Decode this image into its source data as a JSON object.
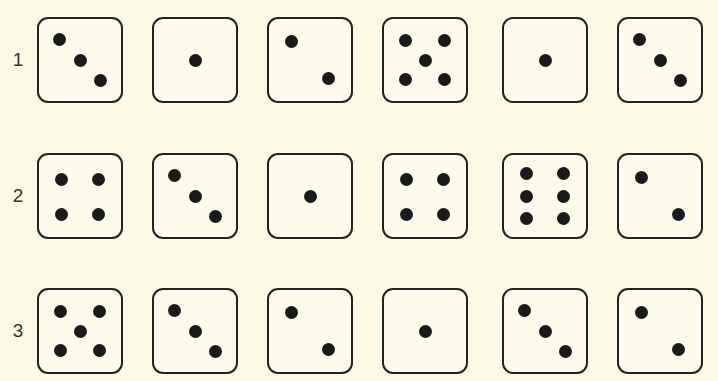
{
  "figure": {
    "rows": [
      {
        "label": "1",
        "dice": [
          {
            "value": 3,
            "orientation": "tl-br"
          },
          {
            "value": 1,
            "orientation": "center"
          },
          {
            "value": 2,
            "orientation": "tl-br"
          },
          {
            "value": 5,
            "orientation": "standard"
          },
          {
            "value": 1,
            "orientation": "center"
          },
          {
            "value": 3,
            "orientation": "tl-br"
          }
        ]
      },
      {
        "label": "2",
        "dice": [
          {
            "value": 4,
            "orientation": "standard"
          },
          {
            "value": 3,
            "orientation": "tl-br"
          },
          {
            "value": 1,
            "orientation": "center"
          },
          {
            "value": 4,
            "orientation": "standard"
          },
          {
            "value": 6,
            "orientation": "vertical-columns"
          },
          {
            "value": 2,
            "orientation": "tl-br"
          }
        ]
      },
      {
        "label": "3",
        "dice": [
          {
            "value": 5,
            "orientation": "standard"
          },
          {
            "value": 3,
            "orientation": "tl-br"
          },
          {
            "value": 2,
            "orientation": "tl-br"
          },
          {
            "value": 1,
            "orientation": "center"
          },
          {
            "value": 3,
            "orientation": "tl-br"
          },
          {
            "value": 2,
            "orientation": "tl-br"
          }
        ]
      }
    ]
  },
  "colors": {
    "background": "#fcfae4",
    "ink": "#1a1a1a"
  }
}
